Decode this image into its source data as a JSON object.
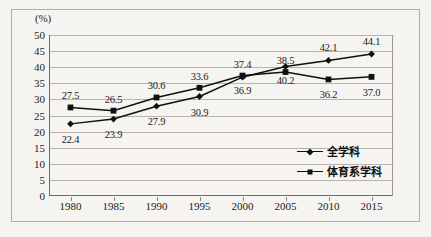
{
  "chart_data": {
    "type": "line",
    "title": "",
    "xlabel": "",
    "ylabel": "(%)",
    "unit_label": "(%)",
    "categories": [
      "1980",
      "1985",
      "1990",
      "1995",
      "2000",
      "2005",
      "2010",
      "2015"
    ],
    "x": [
      1980,
      1985,
      1990,
      1995,
      2000,
      2005,
      2010,
      2015
    ],
    "xlim": [
      1977.5,
      2017.5
    ],
    "ylim": [
      0,
      50
    ],
    "yticks": [
      "0",
      "5",
      "10",
      "15",
      "20",
      "25",
      "30",
      "35",
      "40",
      "45",
      "50"
    ],
    "grid": true,
    "legend_position": "inside-lower-right",
    "series": [
      {
        "name": "全学科",
        "marker": "diamond",
        "color": "#101010",
        "values": [
          22.4,
          23.9,
          27.9,
          30.9,
          36.9,
          40.2,
          42.1,
          44.1
        ],
        "labels": [
          "22.4",
          "23.9",
          "27.9",
          "30.9",
          "36.9",
          "40.2",
          "42.1",
          "44.1"
        ]
      },
      {
        "name": "体育系学科",
        "marker": "square",
        "color": "#101010",
        "values": [
          27.5,
          26.5,
          30.6,
          33.6,
          37.4,
          38.5,
          36.2,
          37.0
        ],
        "labels": [
          "27.5",
          "26.5",
          "30.6",
          "33.6",
          "37.4",
          "38.5",
          "36.2",
          "37.0"
        ]
      }
    ]
  },
  "legend": {
    "items": [
      {
        "label": "全学科",
        "marker": "diamond"
      },
      {
        "label": "体育系学科",
        "marker": "square"
      }
    ]
  },
  "colors": {
    "background": "#f6f4f0",
    "frame": "#b3aea6",
    "axis": "#6e6a64",
    "gridline": "#b8b3ab",
    "series": "#101010",
    "text": "#1b1b1b"
  }
}
